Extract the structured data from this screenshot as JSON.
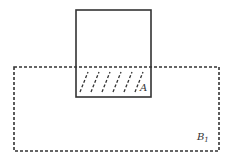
{
  "diagram": {
    "type": "set-overlap",
    "shapes": [
      {
        "id": "square",
        "style": "solid",
        "x": 76,
        "y": 10,
        "width": 75,
        "height": 87
      },
      {
        "id": "B1",
        "style": "dashed",
        "x": 14,
        "y": 67,
        "width": 205,
        "height": 84
      }
    ],
    "overlap_region": {
      "label": "A",
      "hatched": true
    },
    "labels": {
      "A": "A",
      "B": "B",
      "B_sub": "1"
    },
    "colors": {
      "stroke": "#333333",
      "background": "#ffffff"
    }
  }
}
